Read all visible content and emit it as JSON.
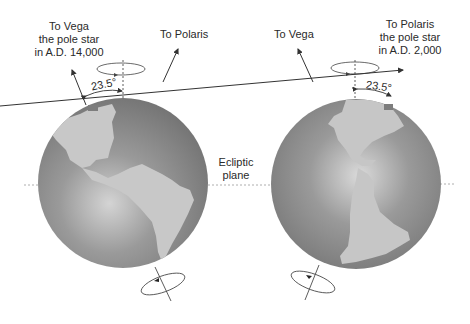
{
  "diagram": {
    "colors": {
      "ocean": "#7d7d7d",
      "ocean_highlight": "#c9c9c9",
      "land": "#c4c4c4",
      "line": "#333333",
      "ecliptic": "#999999"
    },
    "ecliptic_label": [
      "Ecliptic",
      "plane"
    ],
    "left_globe": {
      "star_label_tilted": [
        "To Vega",
        "the pole star",
        "in A.D. 14,000"
      ],
      "star_label_other": "To Polaris",
      "tilt_angle": "23.5°"
    },
    "right_globe": {
      "star_label_other": "To Vega",
      "star_label_tilted": [
        "To Polaris",
        "the pole star",
        "in A.D. 2,000"
      ],
      "tilt_angle": "23.5°"
    }
  }
}
